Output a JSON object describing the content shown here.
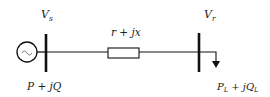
{
  "diagram": {
    "type": "single-line power system",
    "sending_bus": {
      "label": "V",
      "subscript": "s"
    },
    "receiving_bus": {
      "label": "V",
      "subscript": "r"
    },
    "line_impedance": {
      "label": "r + jx"
    },
    "source_power": {
      "label": "P + jQ"
    },
    "load_power": {
      "p": "P",
      "p_sub": "L",
      "mid": " + j",
      "q": "Q",
      "q_sub": "L"
    },
    "generator_symbol": "~",
    "colors": {
      "stroke": "#111111",
      "text": "#222222"
    }
  }
}
